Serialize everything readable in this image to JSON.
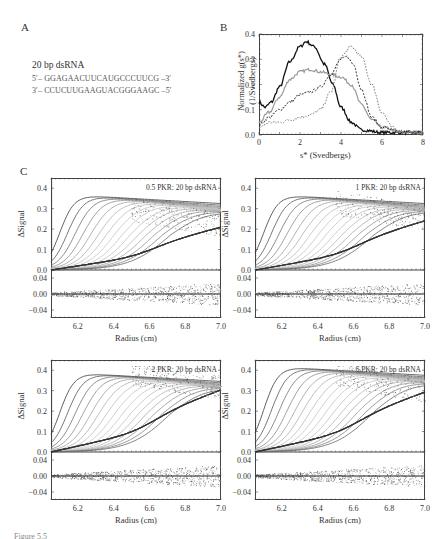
{
  "panel_a": {
    "letter": "A",
    "title": "20 bp dsRNA",
    "strand_top": "5′– GGAGAACUUCAUGCCCUUCG –3′",
    "strand_bottom": "3′– CCUCUUGAAGUACGGGAAGC –5′"
  },
  "panel_b": {
    "letter": "B"
  },
  "panel_c": {
    "letter": "C"
  },
  "caption": {
    "text": "Figure 5.5"
  },
  "chart_data": [
    {
      "id": "B",
      "type": "line",
      "title": "",
      "xlabel": "s* (Svedbergs)",
      "ylabel": "Normalized g(s*) (1/Svedbergs)",
      "xlim": [
        0,
        8
      ],
      "ylim": [
        0,
        0.4
      ],
      "xticks": [
        "0",
        "2",
        "4",
        "6",
        "8"
      ],
      "yticks": [
        "0.0",
        "0.1",
        "0.2",
        "0.3",
        "0.4"
      ],
      "grid": false,
      "series": [
        {
          "name": "solid black",
          "style": "solid",
          "x": [
            0,
            0.3,
            0.6,
            1.0,
            1.5,
            2.0,
            2.3,
            2.7,
            3.2,
            3.6,
            4.0,
            4.5,
            5.0,
            6.0,
            7.0,
            8.0
          ],
          "y": [
            0.13,
            0.11,
            0.13,
            0.19,
            0.29,
            0.35,
            0.37,
            0.35,
            0.28,
            0.2,
            0.11,
            0.05,
            0.02,
            0.01,
            0.01,
            0.01
          ]
        },
        {
          "name": "gray",
          "style": "solid-gray",
          "x": [
            0,
            0.5,
            1.0,
            1.5,
            2.0,
            2.5,
            3.0,
            3.5,
            4.0,
            4.5,
            5.0,
            5.5,
            6.0,
            7.0,
            8.0
          ],
          "y": [
            0.05,
            0.09,
            0.15,
            0.22,
            0.25,
            0.26,
            0.25,
            0.24,
            0.23,
            0.2,
            0.12,
            0.06,
            0.03,
            0.01,
            0.01
          ]
        },
        {
          "name": "dashed dark",
          "style": "dash",
          "x": [
            0,
            0.5,
            1.0,
            1.5,
            2.0,
            2.5,
            3.0,
            3.5,
            4.0,
            4.3,
            4.6,
            5.0,
            5.5,
            6.0,
            7.0,
            8.0
          ],
          "y": [
            0.04,
            0.07,
            0.1,
            0.13,
            0.16,
            0.17,
            0.19,
            0.24,
            0.3,
            0.31,
            0.28,
            0.18,
            0.07,
            0.03,
            0.01,
            0.01
          ]
        },
        {
          "name": "dotted light",
          "style": "dot",
          "x": [
            0,
            0.5,
            1.0,
            1.5,
            2.0,
            2.5,
            3.0,
            3.5,
            4.0,
            4.5,
            5.0,
            5.5,
            6.0,
            6.5,
            7.0,
            8.0
          ],
          "y": [
            0.03,
            0.05,
            0.05,
            0.06,
            0.07,
            0.08,
            0.1,
            0.17,
            0.31,
            0.35,
            0.31,
            0.2,
            0.09,
            0.03,
            0.01,
            0.01
          ]
        }
      ]
    },
    {
      "id": "C1",
      "type": "scatter",
      "annotation": "0.5 PKR: 20 bp dsRNA",
      "xlabel": "Radius (cm)",
      "ylabel": "ΔSignal",
      "xlim": [
        6.05,
        7.0
      ],
      "ylim": [
        0,
        0.45
      ],
      "residual_ylim": [
        -0.06,
        0.06
      ],
      "xticks": [
        "6.2",
        "6.4",
        "6.6",
        "6.8",
        "7.0"
      ],
      "yticks": [
        "0.0",
        "0.1",
        "0.2",
        "0.3",
        "0.4"
      ],
      "residual_yticks": [
        "−0.04",
        "0.00",
        "0.04"
      ],
      "plateau": 0.37,
      "final_value": 0.2
    },
    {
      "id": "C2",
      "type": "scatter",
      "annotation": "1 PKR: 20 bp dsRNA",
      "xlabel": "Radius (cm)",
      "ylabel": "ΔSignal",
      "xlim": [
        6.05,
        7.0
      ],
      "ylim": [
        0,
        0.45
      ],
      "residual_ylim": [
        -0.06,
        0.06
      ],
      "xticks": [
        "6.2",
        "6.4",
        "6.6",
        "6.8",
        "7.0"
      ],
      "yticks": [
        "0.0",
        "0.1",
        "0.2",
        "0.3",
        "0.4"
      ],
      "residual_yticks": [
        "−0.04",
        "0.00",
        "0.04"
      ],
      "plateau": 0.37,
      "final_value": 0.23
    },
    {
      "id": "C3",
      "type": "scatter",
      "annotation": "2 PKR: 20 bp dsRNA",
      "xlabel": "Radius (cm)",
      "ylabel": "ΔSignal",
      "xlim": [
        6.05,
        7.0
      ],
      "ylim": [
        0,
        0.45
      ],
      "residual_ylim": [
        -0.06,
        0.06
      ],
      "xticks": [
        "6.2",
        "6.4",
        "6.6",
        "6.8",
        "7.0"
      ],
      "yticks": [
        "0.0",
        "0.1",
        "0.2",
        "0.3",
        "0.4"
      ],
      "residual_yticks": [
        "−0.04",
        "0.00",
        "0.04"
      ],
      "plateau": 0.39,
      "final_value": 0.29
    },
    {
      "id": "C4",
      "type": "scatter",
      "annotation": "6 PKR: 20 bp dsRNA",
      "xlabel": "Radius (cm)",
      "ylabel": "ΔSignal",
      "xlim": [
        6.05,
        7.0
      ],
      "ylim": [
        0,
        0.45
      ],
      "residual_ylim": [
        -0.06,
        0.06
      ],
      "xticks": [
        "6.2",
        "6.4",
        "6.6",
        "6.8",
        "7.0"
      ],
      "yticks": [
        "0.0",
        "0.1",
        "0.2",
        "0.3",
        "0.4"
      ],
      "residual_yticks": [
        "−0.04",
        "0.00",
        "0.04"
      ],
      "plateau": 0.42,
      "final_value": 0.28
    }
  ],
  "labels": {
    "b_xlabel": "s* (Svedbergs)",
    "b_ylabel_1": "Normalized g(s*)",
    "b_ylabel_2": "(1/Svedbergs)",
    "c_xlabel": "Radius (cm)",
    "c_ylabel": "ΔSignal"
  }
}
